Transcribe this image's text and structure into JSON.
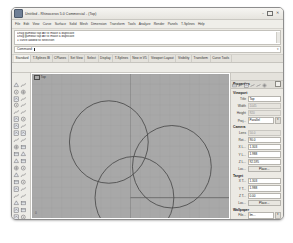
{
  "window": {
    "title": "Untitled - Rhinoceros 5.0 Commercial - (Top)",
    "app_icon": "rhino-icon",
    "minimize": "–",
    "maximize": "□",
    "close": "✕"
  },
  "menubar": {
    "items": [
      {
        "label": "File"
      },
      {
        "label": "Edit"
      },
      {
        "label": "View"
      },
      {
        "label": "Curve"
      },
      {
        "label": "Surface"
      },
      {
        "label": "Solid"
      },
      {
        "label": "Mesh"
      },
      {
        "label": "Dimension"
      },
      {
        "label": "Transform"
      },
      {
        "label": "Tools"
      },
      {
        "label": "Analyze"
      },
      {
        "label": "Render"
      },
      {
        "label": "Panels"
      },
      {
        "label": "T-Splines"
      },
      {
        "label": "Help"
      }
    ]
  },
  "command_history": {
    "lines": [
      "Drag gumball tap Alt to make a duplicate",
      "Drag gumball tap Alt to make a duplicate",
      "1 curve added to selection"
    ]
  },
  "command_prompt": {
    "label": "Command:",
    "value": "",
    "placeholder": "Command:"
  },
  "toolbar_tabs": {
    "items": [
      {
        "label": "Standard",
        "active": true
      },
      {
        "label": "T-Splines IB",
        "active": false
      },
      {
        "label": "CPlanes",
        "active": false
      },
      {
        "label": "Set View",
        "active": false
      },
      {
        "label": "Select",
        "active": false
      },
      {
        "label": "Display",
        "active": false
      },
      {
        "label": "T-Splines",
        "active": false
      },
      {
        "label": "New in V5",
        "active": false
      },
      {
        "label": "Viewport Layout",
        "active": false
      },
      {
        "label": "Visibility",
        "active": false
      },
      {
        "label": "Transform",
        "active": false
      },
      {
        "label": "Curve Tools",
        "active": false
      }
    ]
  },
  "top_toolbar": {
    "icons": [
      "new-file-icon",
      "open-file-icon",
      "save-icon",
      "print-icon",
      "cut-icon",
      "copy-icon",
      "paste-icon",
      "undo-icon",
      "redo-icon",
      "delete-icon",
      "zoom-extents-icon",
      "zoom-window-icon",
      "pan-icon",
      "rotate-view-icon",
      "line-icon",
      "polyline-icon",
      "curve-icon",
      "arc-icon",
      "circle-icon",
      "ellipse-icon",
      "rectangle-icon",
      "polygon-icon",
      "surface-icon",
      "loft-icon",
      "revolve-icon",
      "sweep-icon",
      "extrude-icon",
      "boolean-union-icon",
      "boolean-difference-icon",
      "fillet-icon",
      "chamfer-icon",
      "offset-icon",
      "trim-icon",
      "split-icon",
      "join-icon",
      "explode-icon",
      "layer-icon",
      "properties-icon",
      "osnap-icon",
      "render-icon",
      "shade-icon",
      "grid-snap-icon",
      "ortho-icon",
      "planar-icon"
    ]
  },
  "left_toolbar": {
    "icons": [
      "select-icon",
      "select-window-icon",
      "point-icon",
      "points-icon",
      "line-icon",
      "polyline-icon",
      "curve-icon",
      "freeform-curve-icon",
      "arc-icon",
      "circle-icon",
      "ellipse-icon",
      "rectangle-icon",
      "polygon-icon",
      "curve-tools-icon",
      "surface-plane-icon",
      "surface-loft-icon",
      "surface-revolve-icon",
      "surface-sweep-icon",
      "solid-box-icon",
      "solid-sphere-icon",
      "solid-cylinder-icon",
      "solid-cone-icon",
      "mesh-icon",
      "mesh-tools-icon",
      "transform-move-icon",
      "transform-rotate-icon",
      "transform-scale-icon",
      "transform-mirror-icon",
      "array-icon",
      "boolean-icon",
      "trim-split-icon",
      "fillet-icon",
      "offset-icon",
      "join-icon",
      "analyze-icon",
      "dimension-icon",
      "text-icon",
      "hatch-icon",
      "layer-icon",
      "light-icon",
      "render-icon",
      "display-icon"
    ]
  },
  "viewport": {
    "label": "Top",
    "label_glyph": "viewport-menu-icon",
    "origin_marker": "0",
    "background_color": "#a8a8a8",
    "grid_color": "#9b9b9b",
    "axis_color": "#5d5d5d",
    "curve_color": "#4a4a4a",
    "objects": [
      {
        "type": "circle",
        "name": "circle-top-left",
        "cx": 78,
        "cy": 66,
        "r": 40
      },
      {
        "type": "circle",
        "name": "circle-right",
        "cx": 142,
        "cy": 90,
        "r": 40
      },
      {
        "type": "circle",
        "name": "circle-bottom",
        "cx": 104,
        "cy": 120,
        "r": 40
      }
    ]
  },
  "properties_panel": {
    "tab_icons": [
      "properties-tab-icon",
      "layers-tab-icon",
      "display-tab-icon",
      "render-tab-icon",
      "named-views-tab-icon",
      "help-tab-icon"
    ],
    "header": {
      "title": "Properties",
      "collapse_button": "panel-collapse-button"
    },
    "sections": [
      {
        "name": "Viewport",
        "rows": [
          {
            "label": "Title",
            "value": "Top",
            "type": "text"
          },
          {
            "label": "Width",
            "value": "1045",
            "type": "readonly"
          },
          {
            "label": "Height",
            "value": "920",
            "type": "readonly"
          },
          {
            "label": "Proj...",
            "value": "Parallel",
            "type": "dropdown"
          }
        ]
      },
      {
        "name": "Camera",
        "rows": [
          {
            "label": "Lens",
            "value": "50.0",
            "type": "readonly"
          },
          {
            "label": "Rot...",
            "value": "90.0",
            "type": "text"
          },
          {
            "label": "X L...",
            "value": "1.303",
            "type": "text"
          },
          {
            "label": "Y L...",
            "value": "1.988",
            "type": "text"
          },
          {
            "label": "Z L...",
            "value": "92.595",
            "type": "text"
          },
          {
            "label": "Loc...",
            "value": "Place...",
            "type": "button"
          }
        ]
      },
      {
        "name": "Target",
        "rows": [
          {
            "label": "X T...",
            "value": "1.303",
            "type": "text"
          },
          {
            "label": "Y T...",
            "value": "1.988",
            "type": "text"
          },
          {
            "label": "Z T...",
            "value": "0.00",
            "type": "text"
          },
          {
            "label": "Loc...",
            "value": "Place...",
            "type": "button"
          }
        ]
      },
      {
        "name": "Wallpaper",
        "rows": [
          {
            "label": "File...",
            "value": "Im...",
            "type": "dropdown"
          },
          {
            "label": "Show",
            "value": "",
            "type": "checkbox"
          },
          {
            "label": "Gray",
            "value": "",
            "type": "checkbox"
          }
        ]
      }
    ]
  }
}
